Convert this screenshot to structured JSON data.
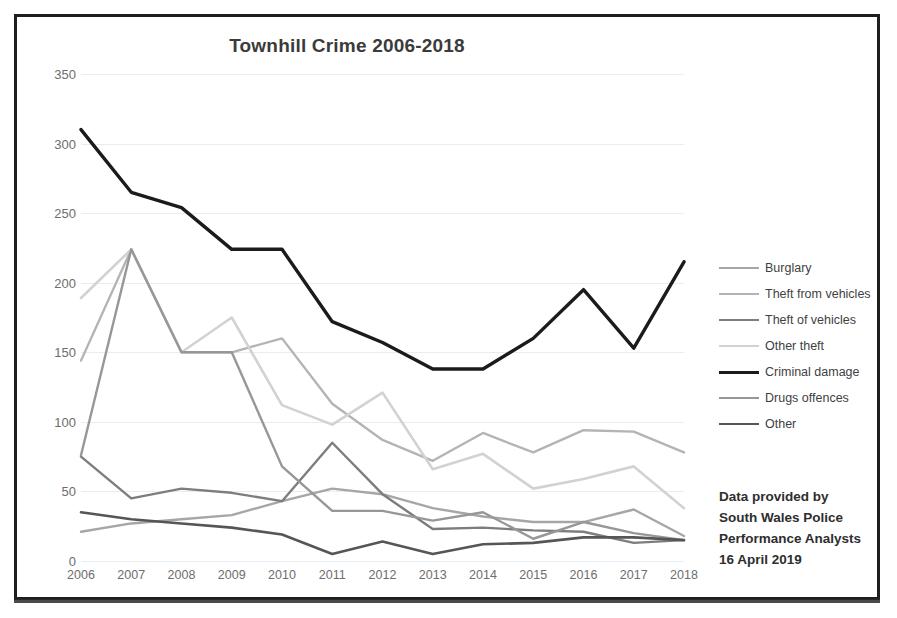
{
  "chart_data": {
    "type": "line",
    "title": "Townhill Crime 2006-2018",
    "xlabel": "",
    "ylabel": "",
    "ylim": [
      0,
      350
    ],
    "ytick_step": 50,
    "yticks": [
      "350",
      "300",
      "250",
      "200",
      "150",
      "100",
      "50",
      "0"
    ],
    "grid": true,
    "legend_position": "right",
    "categories": [
      "2006",
      "2007",
      "2008",
      "2009",
      "2010",
      "2011",
      "2012",
      "2013",
      "2014",
      "2015",
      "2016",
      "2017",
      "2018"
    ],
    "series": [
      {
        "name": "Burglary",
        "color": "#a6a6a6",
        "width": 2.4,
        "values": [
          21,
          27,
          30,
          33,
          43,
          52,
          48,
          38,
          32,
          28,
          28,
          37,
          18
        ]
      },
      {
        "name": "Theft from vehicles",
        "color": "#b4b4b4",
        "width": 2.4,
        "values": [
          144,
          224,
          150,
          150,
          160,
          113,
          87,
          72,
          92,
          78,
          94,
          93,
          78
        ]
      },
      {
        "name": "Theft of vehicles",
        "color": "#7d7d7d",
        "width": 2.4,
        "values": [
          75,
          45,
          52,
          49,
          43,
          85,
          48,
          23,
          24,
          22,
          21,
          13,
          15
        ]
      },
      {
        "name": "Other theft",
        "color": "#d2d2d2",
        "width": 2.6,
        "values": [
          189,
          224,
          150,
          175,
          112,
          98,
          121,
          66,
          77,
          52,
          59,
          68,
          38
        ]
      },
      {
        "name": "Criminal damage",
        "color": "#1b1b1b",
        "width": 3.4,
        "values": [
          310,
          265,
          254,
          224,
          224,
          172,
          157,
          138,
          138,
          160,
          195,
          153,
          215
        ]
      },
      {
        "name": "Drugs offences",
        "color": "#979797",
        "width": 2.4,
        "values": [
          76,
          224,
          150,
          150,
          68,
          36,
          36,
          29,
          35,
          16,
          28,
          20,
          15
        ]
      },
      {
        "name": "Other",
        "color": "#565656",
        "width": 2.6,
        "values": [
          35,
          30,
          27,
          24,
          19,
          5,
          14,
          5,
          12,
          13,
          17,
          17,
          15
        ]
      }
    ]
  },
  "attribution": {
    "line1": "Data provided by",
    "line2": "South Wales Police",
    "line3": "Performance Analysts",
    "line4": "16 April 2019"
  }
}
